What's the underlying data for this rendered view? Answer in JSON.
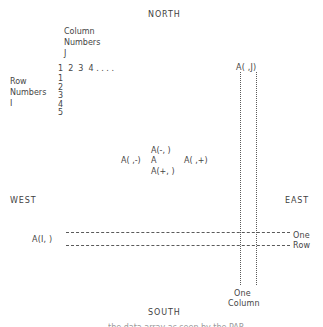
{
  "diagram": {
    "compass": {
      "north": "NORTH",
      "south": "SOUTH",
      "east": "EAST",
      "west": "WEST"
    },
    "column_header": {
      "line1": "Column",
      "line2": "Numbers",
      "line3": "J",
      "numbers": "1  2  3  4 . . . ."
    },
    "row_header": {
      "line1": "Row",
      "line2": "Numbers",
      "line3": "I",
      "numbers": "1\n2\n3\n4\n5"
    },
    "neighbor_cluster": {
      "up": "A(-, )",
      "left": "A( ,-)",
      "center": "A",
      "right": "A( ,+)",
      "down": "A(+, )"
    },
    "annotations": {
      "column_ref": "A( ,J)",
      "row_ref": "A(I, )",
      "one_row_line1": "One",
      "one_row_line2": "Row",
      "one_column_line1": "One",
      "one_column_line2": "Column"
    },
    "clipped_caption": "the data array as seen by the PAR",
    "colors": {
      "background": "#ffffff",
      "text": "#454545",
      "line": "#5a5a5a"
    }
  }
}
